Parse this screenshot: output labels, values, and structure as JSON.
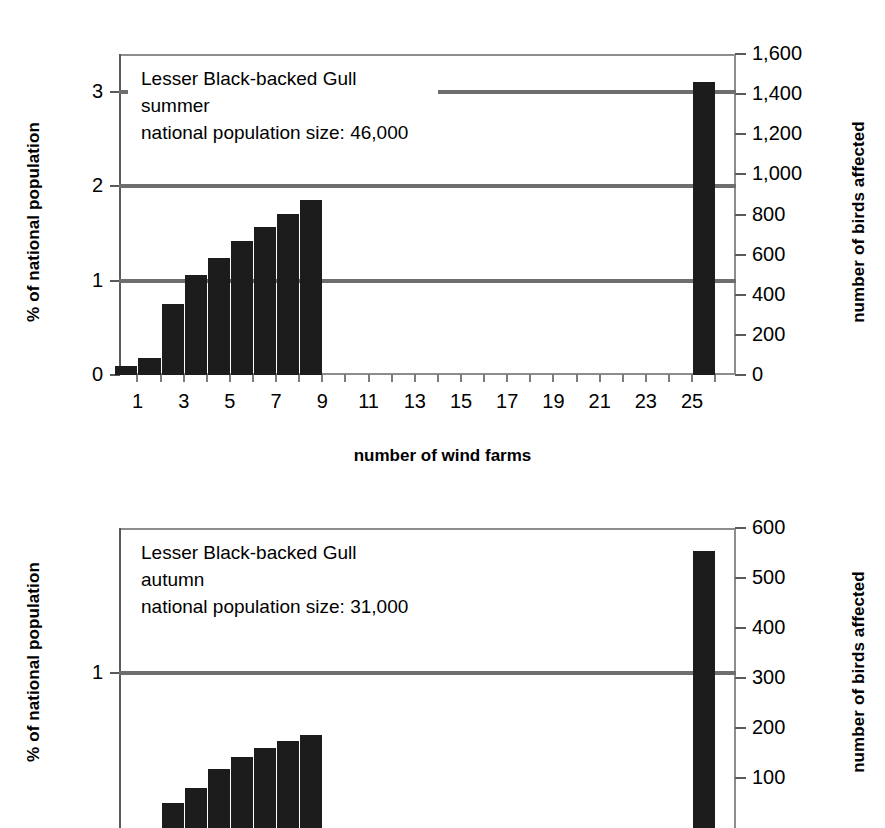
{
  "chart_data": [
    {
      "id": "summer",
      "type": "bar",
      "title": "Lesser Black-backed Gull",
      "season": "summer",
      "population_note": "national population size: 46,000",
      "annotation_lines": [
        "Lesser Black-backed Gull",
        "summer",
        "national population size: 46,000"
      ],
      "xlabel": "number of wind farms",
      "ylabel": "% of national population",
      "ylabel_right": "number of birds affected",
      "x": [
        1,
        2,
        3,
        4,
        5,
        6,
        7,
        8,
        9,
        26
      ],
      "values": [
        0.1,
        0.18,
        0.75,
        1.06,
        1.24,
        1.42,
        1.57,
        1.71,
        1.85,
        3.1
      ],
      "values_right_axis": [
        46,
        83,
        345,
        488,
        570,
        653,
        722,
        787,
        851,
        1426
      ],
      "categories": [
        "1",
        "2",
        "3",
        "4",
        "5",
        "6",
        "7",
        "8",
        "9",
        "26"
      ],
      "xtick_labels": [
        "1",
        "3",
        "5",
        "7",
        "9",
        "11",
        "13",
        "15",
        "17",
        "19",
        "21",
        "23",
        "25"
      ],
      "xtick_values": [
        1,
        3,
        5,
        7,
        9,
        11,
        13,
        15,
        17,
        19,
        21,
        23,
        25
      ],
      "xlim": [
        0.2,
        26.9
      ],
      "ylim": [
        0,
        3.4
      ],
      "ytick_labels": [
        "0",
        "1",
        "2",
        "3"
      ],
      "ytick_values": [
        0,
        1,
        2,
        3
      ],
      "ylim_right": [
        0,
        1600
      ],
      "ytick_labels_right": [
        "0",
        "200",
        "400",
        "600",
        "800",
        "1,000",
        "1,200",
        "1,400",
        "1,600"
      ],
      "ytick_values_right": [
        0,
        200,
        400,
        600,
        800,
        1000,
        1200,
        1400,
        1600
      ],
      "gridlines": [
        {
          "value": 1,
          "span": "full"
        },
        {
          "value": 2,
          "span": "full"
        },
        {
          "value": 3,
          "span": "partial"
        }
      ],
      "grid": true,
      "legend": "none",
      "bar_color": "#1c1c1c",
      "grid_color": "#6e6e6e"
    },
    {
      "id": "autumn",
      "type": "bar",
      "title": "Lesser Black-backed Gull",
      "season": "autumn",
      "population_note": "national population size: 31,000",
      "annotation_lines": [
        "Lesser Black-backed Gull",
        "autumn",
        "national population size: 31,000"
      ],
      "xlabel": "number of wind farms",
      "ylabel": "% of national population",
      "ylabel_right": "number of birds affected",
      "x": [
        3,
        4,
        5,
        6,
        7,
        8,
        9,
        26
      ],
      "values": [
        0.16,
        0.26,
        0.38,
        0.46,
        0.52,
        0.56,
        0.6,
        1.79
      ],
      "values_right_axis": [
        50,
        80,
        117,
        142,
        160,
        174,
        186,
        555
      ],
      "categories": [
        "3",
        "4",
        "5",
        "6",
        "7",
        "8",
        "9",
        "26"
      ],
      "xtick_labels": [],
      "xtick_values": [],
      "xlim": [
        0.2,
        26.9
      ],
      "ylim": [
        0,
        1.94
      ],
      "ytick_labels": [
        "1"
      ],
      "ytick_values": [
        1
      ],
      "ylim_right": [
        0,
        600
      ],
      "ytick_labels_right": [
        "100",
        "200",
        "300",
        "400",
        "500",
        "600"
      ],
      "ytick_values_right": [
        100,
        200,
        300,
        400,
        500,
        600
      ],
      "gridlines": [
        {
          "value": 1,
          "span": "full"
        }
      ],
      "grid": true,
      "legend": "none",
      "bar_color": "#1c1c1c",
      "grid_color": "#6e6e6e",
      "note": "lower portion cropped by image edge"
    }
  ],
  "summer": {
    "annotation": "Lesser Black-backed Gull\nsummer\nnational population size: 46,000",
    "ylabel_left": "% of national population",
    "ylabel_right": "number of birds affected",
    "xlabel": "number of wind farms"
  },
  "autumn": {
    "annotation": "Lesser Black-backed Gull\nautumn\nnational population size: 31,000",
    "ylabel_left": "% of national population",
    "ylabel_right": "number of birds affected"
  }
}
